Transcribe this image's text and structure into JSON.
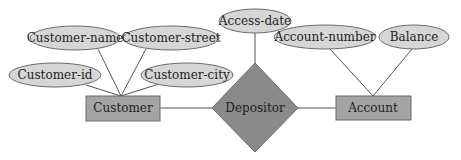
{
  "diagram": {
    "type": "er-diagram",
    "colors": {
      "attribute_fill": "#d6d6d6",
      "entity_fill": "#a4a4a4",
      "relationship_fill": "#8a8a8a",
      "stroke": "#6b6b6b",
      "line": "#555555",
      "text": "#222222"
    },
    "entities": [
      {
        "id": "customer",
        "label": "Customer"
      },
      {
        "id": "account",
        "label": "Account"
      }
    ],
    "relationships": [
      {
        "id": "depositor",
        "label": "Depositor",
        "connects": [
          "customer",
          "account"
        ]
      }
    ],
    "attributes": [
      {
        "id": "customer-name",
        "label": "Customer-name",
        "of": "customer"
      },
      {
        "id": "customer-street",
        "label": "Customer-street",
        "of": "customer"
      },
      {
        "id": "customer-id",
        "label": "Customer-id",
        "of": "customer"
      },
      {
        "id": "customer-city",
        "label": "Customer-city",
        "of": "customer"
      },
      {
        "id": "access-date",
        "label": "Access-date",
        "of": "depositor"
      },
      {
        "id": "account-number",
        "label": "Account-number",
        "of": "account"
      },
      {
        "id": "balance",
        "label": "Balance",
        "of": "account"
      }
    ]
  }
}
